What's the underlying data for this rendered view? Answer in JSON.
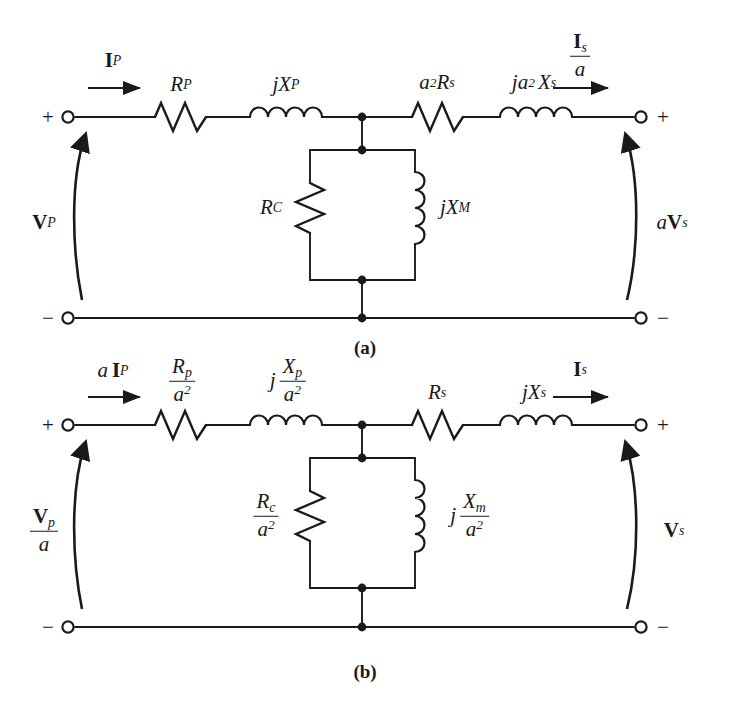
{
  "figure": {
    "background": "#ffffff",
    "line_color": "#1a1a1a"
  },
  "circuit_a": {
    "caption": "(a)",
    "terminal_signs": {
      "left_top": "+",
      "left_bottom": "−",
      "right_top": "+",
      "right_bottom": "−"
    },
    "current_left": {
      "bold_part": "I",
      "sub": "P",
      "prefix": "",
      "arrow": "right-arrow-icon"
    },
    "current_right": {
      "numerator_bold": "I",
      "numerator_sub": "s",
      "denominator": "a",
      "arrow": "right-arrow-icon"
    },
    "voltage_left": {
      "bold_part": "V",
      "sub": "P",
      "prefix": "",
      "arrow": "curved-up-arrow-icon"
    },
    "voltage_right": {
      "prefix": "a",
      "bold_part": "V",
      "sub": "s",
      "arrow": "curved-up-arrow-icon"
    },
    "series_elements": [
      {
        "type": "resistor",
        "name": "primary-resistance",
        "label_main": "R",
        "label_sub": "P",
        "label_prefix": "",
        "label_sup": ""
      },
      {
        "type": "inductor",
        "name": "primary-reactance",
        "label_main": "X",
        "label_sub": "P",
        "label_prefix": "j",
        "label_sup": ""
      },
      {
        "type": "resistor",
        "name": "secondary-resistance-referred",
        "label_main": "R",
        "label_sub": "s",
        "label_prefix": "a",
        "label_sup": "2"
      },
      {
        "type": "inductor",
        "name": "secondary-reactance-referred",
        "label_main": "X",
        "label_sub": "s",
        "label_prefix": "ja",
        "label_sup": "2"
      }
    ],
    "shunt_elements": [
      {
        "type": "resistor",
        "name": "core-loss-resistance",
        "label_main": "R",
        "label_sub": "C",
        "label_prefix": ""
      },
      {
        "type": "inductor",
        "name": "magnetizing-reactance",
        "label_main": "X",
        "label_sub": "M",
        "label_prefix": "j"
      }
    ]
  },
  "circuit_b": {
    "caption": "(b)",
    "terminal_signs": {
      "left_top": "+",
      "left_bottom": "−",
      "right_top": "+",
      "right_bottom": "−"
    },
    "current_left": {
      "prefix": "a",
      "bold_part": "I",
      "sub": "P",
      "arrow": "right-arrow-icon"
    },
    "current_right": {
      "bold_part": "I",
      "sub": "s",
      "arrow": "right-arrow-icon"
    },
    "voltage_left": {
      "numerator_bold": "V",
      "numerator_sub": "p",
      "denominator": "a",
      "arrow": "curved-up-arrow-icon"
    },
    "voltage_right": {
      "bold_part": "V",
      "sub": "s",
      "arrow": "curved-up-arrow-icon"
    },
    "series_elements": [
      {
        "type": "resistor",
        "name": "primary-resistance-referred",
        "num_main": "R",
        "num_sub": "p",
        "den": "a",
        "den_sup": "2",
        "prefix": ""
      },
      {
        "type": "inductor",
        "name": "primary-reactance-referred",
        "num_main": "X",
        "num_sub": "p",
        "den": "a",
        "den_sup": "2",
        "prefix": "j"
      },
      {
        "type": "resistor",
        "name": "secondary-resistance",
        "label_main": "R",
        "label_sub": "s",
        "label_prefix": ""
      },
      {
        "type": "inductor",
        "name": "secondary-reactance",
        "label_main": "X",
        "label_sub": "s",
        "label_prefix": "j"
      }
    ],
    "shunt_elements": [
      {
        "type": "resistor",
        "name": "core-loss-resistance-referred",
        "num_main": "R",
        "num_sub": "c",
        "den": "a",
        "den_sup": "2",
        "prefix": ""
      },
      {
        "type": "inductor",
        "name": "magnetizing-reactance-referred",
        "num_main": "X",
        "num_sub": "m",
        "den": "a",
        "den_sup": "2",
        "prefix": "j"
      }
    ]
  }
}
